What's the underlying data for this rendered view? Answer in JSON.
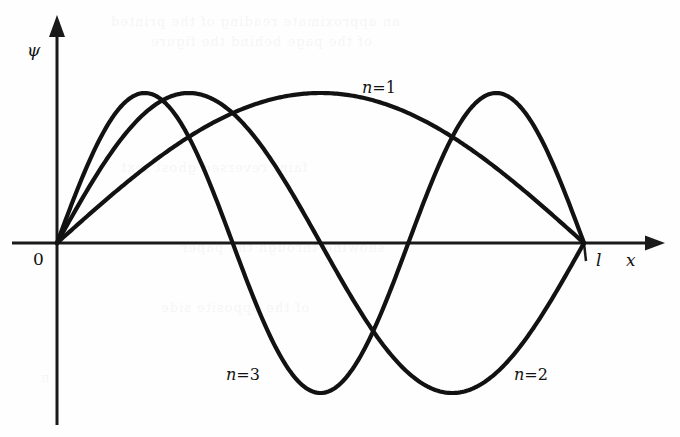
{
  "figure": {
    "background_color": "#fefefe",
    "ink_color": "#121212",
    "axis_color": "#1a1a1a",
    "curve_stroke_width": 4.2,
    "axis_stroke_width": 3.0
  },
  "axes": {
    "y_axis_label": "ψ",
    "x_axis_label": "x",
    "origin_label": "0",
    "box_length_label": "l",
    "origin_px": {
      "x": 57,
      "y": 243
    },
    "box_end_px": {
      "x": 584,
      "y": 243
    },
    "amplitude_px": 150,
    "y_axis_top_px": 15,
    "y_axis_bottom_px": 425,
    "x_axis_left_px": 12,
    "x_axis_right_px": 665
  },
  "labels": {
    "psi": {
      "text": "ψ",
      "x": 27,
      "y": 42
    },
    "zero": {
      "text": "0",
      "x": 33,
      "y": 251
    },
    "ell": {
      "text": "l",
      "x": 596,
      "y": 252
    },
    "x": {
      "text": "x",
      "x": 626,
      "y": 252
    },
    "n1": {
      "n": "n",
      "eq": "=",
      "value": "1",
      "x": 362,
      "y": 80
    },
    "n3": {
      "n": "n",
      "eq": "=",
      "value": "3",
      "x": 226,
      "y": 367
    },
    "n2": {
      "n": "n",
      "eq": "=",
      "value": "2",
      "x": 514,
      "y": 367
    }
  },
  "bleed_through_text": [
    {
      "text": "an approximate reading of the printed",
      "x": 110,
      "y": 14
    },
    {
      "text": "of the page behind the figure",
      "x": 150,
      "y": 34
    },
    {
      "text": "faint reversed ghost text",
      "x": 120,
      "y": 160
    },
    {
      "text": "showing through the paper",
      "x": 180,
      "y": 240
    },
    {
      "text": "of the opposite side",
      "x": 160,
      "y": 300
    },
    {
      "text": "π",
      "x": 40,
      "y": 370
    }
  ],
  "chart_data": {
    "type": "line",
    "title": "",
    "subtitle": "",
    "xlabel": "x",
    "ylabel": "ψ",
    "xlim": [
      0,
      1
    ],
    "ylim": [
      -1.15,
      1.15
    ],
    "grid": false,
    "legend": "inline-annotations",
    "x_tick_labels": [
      "0",
      "l"
    ],
    "x_tick_values": [
      0,
      1
    ],
    "y_tick_labels": [],
    "function": "psi_n(x) = A*sin(n*pi*x/l)",
    "amplitude": 1,
    "series": [
      {
        "name": "n=1",
        "n": 1,
        "label": "n=1",
        "nodes_interior": [],
        "zero_crossings_x": [
          0,
          1
        ],
        "extrema": [
          {
            "x": 0.5,
            "y": 1
          }
        ],
        "x": [
          0,
          0.05,
          0.1,
          0.15,
          0.2,
          0.25,
          0.3,
          0.35,
          0.4,
          0.45,
          0.5,
          0.55,
          0.6,
          0.65,
          0.7,
          0.75,
          0.8,
          0.85,
          0.9,
          0.95,
          1
        ],
        "y": [
          0,
          0.156,
          0.309,
          0.454,
          0.588,
          0.707,
          0.809,
          0.891,
          0.951,
          0.988,
          1,
          0.988,
          0.951,
          0.891,
          0.809,
          0.707,
          0.588,
          0.454,
          0.309,
          0.156,
          0
        ]
      },
      {
        "name": "n=2",
        "n": 2,
        "label": "n=2",
        "nodes_interior": [
          0.5
        ],
        "zero_crossings_x": [
          0,
          0.5,
          1
        ],
        "extrema": [
          {
            "x": 0.25,
            "y": 1
          },
          {
            "x": 0.75,
            "y": -1
          }
        ],
        "x": [
          0,
          0.05,
          0.1,
          0.15,
          0.2,
          0.25,
          0.3,
          0.35,
          0.4,
          0.45,
          0.5,
          0.55,
          0.6,
          0.65,
          0.7,
          0.75,
          0.8,
          0.85,
          0.9,
          0.95,
          1
        ],
        "y": [
          0,
          0.309,
          0.588,
          0.809,
          0.951,
          1,
          0.951,
          0.809,
          0.588,
          0.309,
          0,
          -0.309,
          -0.588,
          -0.809,
          -0.951,
          -1,
          -0.951,
          -0.809,
          -0.588,
          -0.309,
          0
        ]
      },
      {
        "name": "n=3",
        "n": 3,
        "label": "n=3",
        "nodes_interior": [
          0.3333,
          0.6667
        ],
        "zero_crossings_x": [
          0,
          0.3333,
          0.6667,
          1
        ],
        "extrema": [
          {
            "x": 0.1667,
            "y": 1
          },
          {
            "x": 0.5,
            "y": -1
          },
          {
            "x": 0.8333,
            "y": 1
          }
        ],
        "x": [
          0,
          0.05,
          0.1,
          0.15,
          0.2,
          0.25,
          0.3,
          0.35,
          0.4,
          0.45,
          0.5,
          0.55,
          0.6,
          0.65,
          0.7,
          0.75,
          0.8,
          0.85,
          0.9,
          0.95,
          1
        ],
        "y": [
          0,
          0.454,
          0.809,
          0.988,
          0.951,
          0.707,
          0.309,
          -0.156,
          -0.588,
          -0.891,
          -1,
          -0.891,
          -0.588,
          -0.156,
          0.309,
          0.707,
          0.951,
          0.988,
          0.809,
          0.454,
          0
        ]
      }
    ]
  }
}
